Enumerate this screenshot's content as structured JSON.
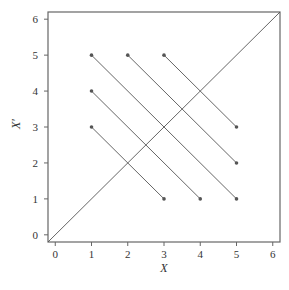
{
  "chart_data": {
    "type": "line",
    "title": "",
    "xlabel": "X",
    "ylabel": "X′",
    "xlim": [
      -0.2,
      6.2
    ],
    "ylim": [
      -0.2,
      6.2
    ],
    "x_ticks": [
      0,
      1,
      2,
      3,
      4,
      5,
      6
    ],
    "y_ticks": [
      0,
      1,
      2,
      3,
      4,
      5,
      6
    ],
    "grid": false,
    "legend": null,
    "diagonal": {
      "from": [
        -0.2,
        -0.2
      ],
      "to": [
        6.2,
        6.2
      ]
    },
    "segments": [
      {
        "from": [
          1,
          3
        ],
        "to": [
          3,
          1
        ]
      },
      {
        "from": [
          1,
          4
        ],
        "to": [
          4,
          1
        ]
      },
      {
        "from": [
          1,
          5
        ],
        "to": [
          5,
          1
        ]
      },
      {
        "from": [
          2,
          5
        ],
        "to": [
          5,
          2
        ]
      },
      {
        "from": [
          3,
          5
        ],
        "to": [
          5,
          3
        ]
      }
    ],
    "colors": {
      "line": "#555555",
      "frame": "#666666",
      "marker": "#555555"
    }
  }
}
